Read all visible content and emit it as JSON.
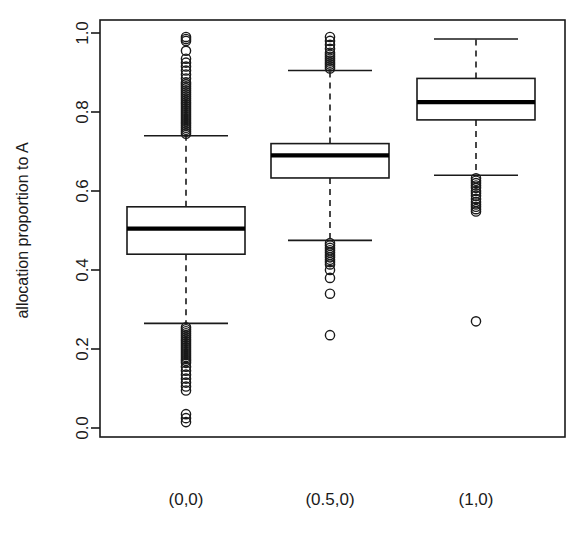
{
  "chart_data": {
    "type": "box",
    "title": "",
    "xlabel": "",
    "ylabel": "allocation proportion to A",
    "ylim": [
      0.0,
      1.0
    ],
    "yticks": [
      0.0,
      0.2,
      0.4,
      0.6,
      0.8,
      1.0
    ],
    "ytick_labels": [
      "0.0",
      "0.2",
      "0.4",
      "0.6",
      "0.8",
      "1.0"
    ],
    "grid": false,
    "legend": "none",
    "categories": [
      "(0,0)",
      "(0.5,0)",
      "(1,0)"
    ],
    "boxes": [
      {
        "category": "(0,0)",
        "whisker_low": 0.265,
        "q1": 0.44,
        "median": 0.505,
        "q3": 0.56,
        "whisker_high": 0.74,
        "outliers_high": [
          0.99,
          0.985,
          0.98,
          0.955,
          0.935,
          0.925,
          0.915,
          0.905,
          0.895,
          0.885,
          0.875,
          0.87,
          0.865,
          0.86,
          0.855,
          0.85,
          0.845,
          0.84,
          0.835,
          0.83,
          0.825,
          0.82,
          0.815,
          0.81,
          0.805,
          0.8,
          0.795,
          0.79,
          0.785,
          0.78,
          0.775,
          0.77,
          0.765,
          0.76,
          0.755,
          0.75,
          0.745
        ],
        "outliers_low": [
          0.255,
          0.25,
          0.245,
          0.24,
          0.235,
          0.23,
          0.225,
          0.22,
          0.215,
          0.21,
          0.205,
          0.2,
          0.195,
          0.19,
          0.185,
          0.18,
          0.175,
          0.17,
          0.165,
          0.155,
          0.145,
          0.135,
          0.125,
          0.115,
          0.105,
          0.095,
          0.035,
          0.025,
          0.015
        ]
      },
      {
        "category": "(0.5,0)",
        "whisker_low": 0.475,
        "q1": 0.633,
        "median": 0.69,
        "q3": 0.72,
        "whisker_high": 0.905,
        "outliers_high": [
          0.99,
          0.98,
          0.97,
          0.96,
          0.95,
          0.945,
          0.94,
          0.935,
          0.93,
          0.925,
          0.92,
          0.915,
          0.91
        ],
        "outliers_low": [
          0.468,
          0.462,
          0.456,
          0.45,
          0.444,
          0.438,
          0.432,
          0.426,
          0.42,
          0.414,
          0.4,
          0.38,
          0.34,
          0.235
        ]
      },
      {
        "category": "(1,0)",
        "whisker_low": 0.64,
        "q1": 0.78,
        "median": 0.825,
        "q3": 0.885,
        "whisker_high": 0.985,
        "outliers_high": [],
        "outliers_low": [
          0.632,
          0.626,
          0.62,
          0.614,
          0.608,
          0.6,
          0.594,
          0.588,
          0.58,
          0.572,
          0.566,
          0.56,
          0.554,
          0.548,
          0.27
        ]
      }
    ]
  },
  "style": {
    "line_color": "#1a1a1a",
    "box_fill": "#ffffff",
    "median_color": "#000000",
    "background": "#ffffff"
  }
}
